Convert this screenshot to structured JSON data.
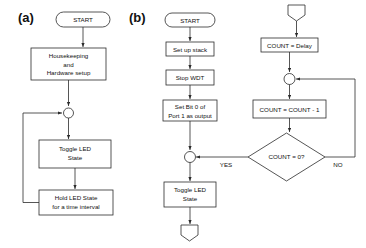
{
  "figure": {
    "type": "flowchart",
    "panels": [
      {
        "id": "a",
        "label": "(a)",
        "nodes": [
          {
            "name": "start-terminal",
            "shape": "stadium",
            "text": "START"
          },
          {
            "name": "housekeeping-process",
            "shape": "rect",
            "lines": [
              "Housekeeping",
              "and",
              "Hardware setup"
            ]
          },
          {
            "name": "merge-connector",
            "shape": "circle",
            "text": ""
          },
          {
            "name": "toggle-led-process",
            "shape": "rect",
            "lines": [
              "Toggle LED",
              "State"
            ]
          },
          {
            "name": "hold-led-process",
            "shape": "rect",
            "lines": [
              "Hold LED  State",
              "for a time interval"
            ]
          }
        ],
        "edges": [
          {
            "from": "start-terminal",
            "to": "housekeeping-process",
            "label": ""
          },
          {
            "from": "housekeeping-process",
            "to": "merge-connector",
            "label": ""
          },
          {
            "from": "merge-connector",
            "to": "toggle-led-process",
            "label": ""
          },
          {
            "from": "toggle-led-process",
            "to": "hold-led-process",
            "label": ""
          },
          {
            "from": "hold-led-process",
            "to": "merge-connector",
            "label": "",
            "style": "feedback-loop-left"
          }
        ]
      },
      {
        "id": "b",
        "label": "(b)",
        "nodes": [
          {
            "name": "start-terminal",
            "shape": "stadium",
            "text": "START"
          },
          {
            "name": "setup-stack-process",
            "shape": "rect",
            "lines": [
              "Set up stack"
            ]
          },
          {
            "name": "stop-wdt-process",
            "shape": "rect",
            "lines": [
              "Stop WDT"
            ]
          },
          {
            "name": "set-bit-process",
            "shape": "rect",
            "lines": [
              "Set Bit 0 of",
              "Port 1 as output"
            ]
          },
          {
            "name": "merge-connector",
            "shape": "circle",
            "text": ""
          },
          {
            "name": "toggle-led-process",
            "shape": "rect",
            "lines": [
              "Toggle LED",
              "State"
            ]
          },
          {
            "name": "offpage-out-connector",
            "shape": "pentagon",
            "text": ""
          },
          {
            "name": "offpage-in-connector",
            "shape": "pentagon",
            "text": ""
          },
          {
            "name": "count-delay-process",
            "shape": "rect",
            "lines": [
              "COUNT = Delay"
            ]
          },
          {
            "name": "loop-merge-connector",
            "shape": "circle",
            "text": ""
          },
          {
            "name": "count-decrement-process",
            "shape": "rect",
            "lines": [
              "COUNT = COUNT  - 1"
            ]
          },
          {
            "name": "count-zero-decision",
            "shape": "diamond",
            "lines": [
              "COUNT = 0?"
            ]
          }
        ],
        "edges": [
          {
            "from": "start-terminal",
            "to": "setup-stack-process",
            "label": ""
          },
          {
            "from": "setup-stack-process",
            "to": "stop-wdt-process",
            "label": ""
          },
          {
            "from": "stop-wdt-process",
            "to": "set-bit-process",
            "label": ""
          },
          {
            "from": "set-bit-process",
            "to": "merge-connector",
            "label": ""
          },
          {
            "from": "merge-connector",
            "to": "toggle-led-process",
            "label": ""
          },
          {
            "from": "toggle-led-process",
            "to": "offpage-out-connector",
            "label": ""
          },
          {
            "from": "offpage-in-connector",
            "to": "count-delay-process",
            "label": ""
          },
          {
            "from": "count-delay-process",
            "to": "loop-merge-connector",
            "label": ""
          },
          {
            "from": "loop-merge-connector",
            "to": "count-decrement-process",
            "label": ""
          },
          {
            "from": "count-decrement-process",
            "to": "count-zero-decision",
            "label": ""
          },
          {
            "from": "count-zero-decision",
            "to": "merge-connector",
            "label": "YES"
          },
          {
            "from": "count-zero-decision",
            "to": "loop-merge-connector",
            "label": "NO",
            "style": "feedback-loop-right"
          }
        ]
      }
    ]
  },
  "labels": {
    "panel_a": "(a)",
    "panel_b": "(b)",
    "a_start": "START",
    "a_housekeeping_1": "Housekeeping",
    "a_housekeeping_2": "and",
    "a_housekeeping_3": "Hardware setup",
    "a_toggle_1": "Toggle LED",
    "a_toggle_2": "State",
    "a_hold_1": "Hold LED  State",
    "a_hold_2": "for a time interval",
    "b_start": "START",
    "b_setup_stack": "Set up stack",
    "b_stop_wdt": "Stop WDT",
    "b_setbit_1": "Set Bit 0 of",
    "b_setbit_2": "Port 1 as output",
    "b_toggle_1": "Toggle LED",
    "b_toggle_2": "State",
    "b_count_delay": "COUNT = Delay",
    "b_count_dec": "COUNT = COUNT  - 1",
    "b_decision": "COUNT = 0?",
    "b_yes": "YES",
    "b_no": "NO"
  },
  "colors": {
    "stroke": "#2b2b2b",
    "fill": "#ffffff",
    "text": "#111111",
    "background": "#ffffff"
  }
}
